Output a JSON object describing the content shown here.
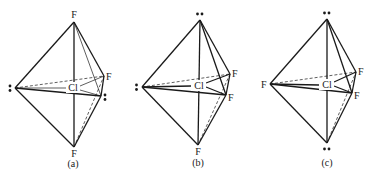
{
  "figure": {
    "central_atom": "Cl",
    "lone_pair_symbol": "••",
    "panels": [
      {
        "id": "a",
        "caption": "(a)",
        "positions": {
          "top": "F",
          "bottom": "F",
          "left": "lone-pair",
          "back_right": "F",
          "front_right": "lone-pair"
        },
        "labels": {
          "top": "F",
          "bottom": "F",
          "back_right": "F",
          "center": "Cl"
        }
      },
      {
        "id": "b",
        "caption": "(b)",
        "positions": {
          "top": "lone-pair",
          "bottom": "F",
          "left": "lone-pair",
          "back_right": "F",
          "front_right": "F"
        },
        "labels": {
          "bottom": "F",
          "back_right": "F",
          "front_right": "F",
          "center": "Cl"
        }
      },
      {
        "id": "c",
        "caption": "(c)",
        "positions": {
          "top": "lone-pair",
          "bottom": "lone-pair",
          "left": "F",
          "back_right": "F",
          "front_right": "F"
        },
        "labels": {
          "left": "F",
          "back_right": "F",
          "front_right": "F",
          "center": "Cl"
        }
      }
    ]
  }
}
